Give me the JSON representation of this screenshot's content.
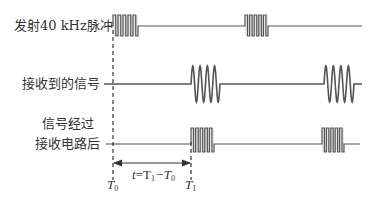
{
  "diagram": {
    "colors": {
      "line": "#555555",
      "text": "#333333",
      "fill": "#bbbbbb"
    },
    "rows": [
      {
        "id": "transmit",
        "label": "发射40 kHz脉冲",
        "waveform": "square-burst",
        "baseline_y": 26,
        "amplitude_top": 15,
        "amplitude_bottom": 36,
        "line_start_x": 107,
        "line_end_x": 362,
        "bursts": [
          {
            "start_x": 113,
            "end_x": 138,
            "cycles": 5
          },
          {
            "start_x": 245,
            "end_x": 268,
            "cycles": 5
          }
        ]
      },
      {
        "id": "receive",
        "label": "接收到的信号",
        "waveform": "sine-burst",
        "baseline_y": 84,
        "amplitude_top": 66,
        "amplitude_bottom": 102,
        "line_start_x": 104,
        "line_end_x": 362,
        "bursts": [
          {
            "start_x": 191,
            "end_x": 220,
            "cycles": 4
          },
          {
            "start_x": 324,
            "end_x": 354,
            "cycles": 4
          }
        ]
      },
      {
        "id": "processed",
        "label_line1": "信号经过",
        "label_line2": "接收电路后",
        "waveform": "square-burst",
        "baseline_y": 144,
        "amplitude_top": 128,
        "amplitude_bottom": 152,
        "line_start_x": 106,
        "line_end_x": 360,
        "bursts": [
          {
            "start_x": 191,
            "end_x": 214,
            "cycles": 5
          },
          {
            "start_x": 322,
            "end_x": 344,
            "cycles": 5
          }
        ]
      }
    ],
    "markers": {
      "t0": {
        "label": "T",
        "sub": "0",
        "x": 113
      },
      "t1": {
        "label": "T",
        "sub": "1",
        "x": 191
      }
    },
    "interval": {
      "label_t": "t",
      "label_eq": "=T",
      "sub1": "1",
      "label_minus": "−T",
      "sub0": "0",
      "arrow_y": 163
    }
  }
}
